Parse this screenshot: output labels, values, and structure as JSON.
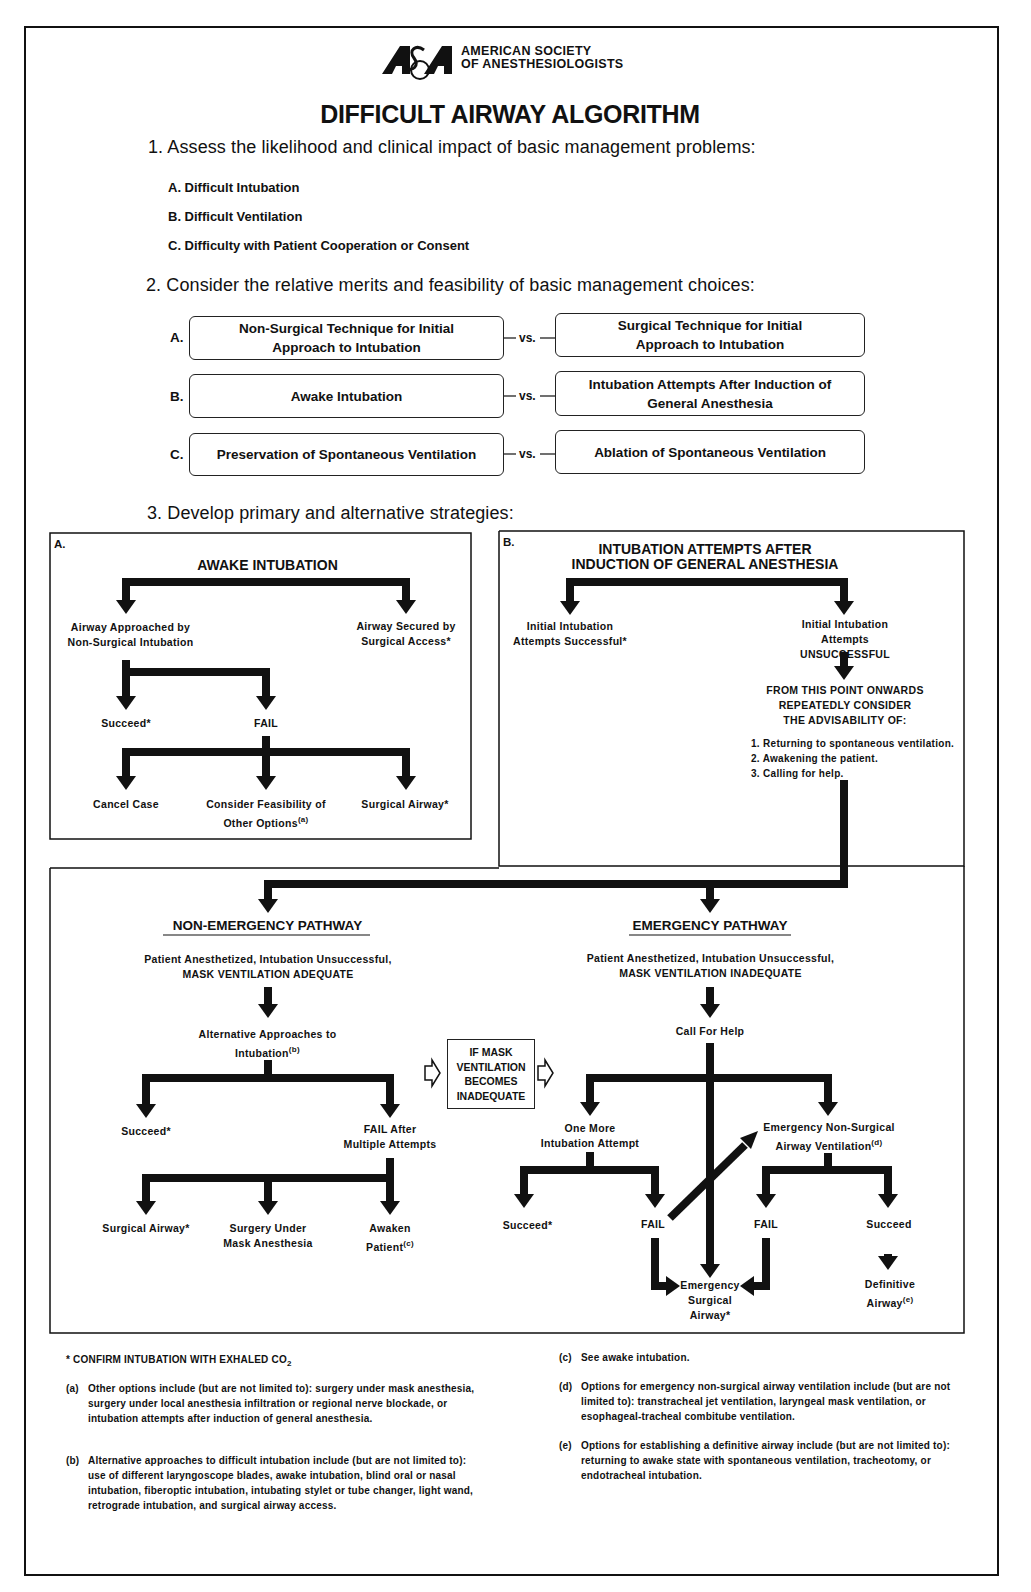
{
  "header": {
    "logo_text": "ASA",
    "org_line1": "AMERICAN SOCIETY",
    "org_line2": "OF ANESTHESIOLOGISTS",
    "title": "DIFFICULT AIRWAY ALGORITHM"
  },
  "step1": {
    "heading": "1. Assess the likelihood and clinical impact of basic management problems:",
    "items": [
      "A. Difficult Intubation",
      "B. Difficult Ventilation",
      "C. Difficulty with Patient Cooperation or Consent"
    ]
  },
  "step2": {
    "heading": "2. Consider the relative merits and feasibility of basic management choices:",
    "vs_label": "vs.",
    "rows": [
      {
        "key": "A.",
        "left": "Non-Surgical Technique for Initial Approach to Intubation",
        "right": "Surgical Technique for Initial Approach to Intubation"
      },
      {
        "key": "B.",
        "left": "Awake Intubation",
        "right": "Intubation Attempts After Induction of General Anesthesia"
      },
      {
        "key": "C.",
        "left": "Preservation of Spontaneous Ventilation",
        "right": "Ablation of Spontaneous Ventilation"
      }
    ]
  },
  "step3": {
    "heading": "3. Develop primary and alternative strategies:",
    "panelA": {
      "key": "A.",
      "title": "AWAKE INTUBATION",
      "left_node": "Airway Approached by Non-Surgical Intubation",
      "right_node": "Airway Secured by Surgical Access*",
      "succeed": "Succeed*",
      "fail": "FAIL",
      "outcomes": [
        "Cancel Case",
        "Consider Feasibility of Other Options",
        "Surgical Airway*"
      ],
      "outcome_footnote": "(a)"
    },
    "panelB": {
      "key": "B.",
      "title_line1": "INTUBATION ATTEMPTS AFTER",
      "title_line2": "INDUCTION OF GENERAL ANESTHESIA",
      "left_node": "Initial Intubation Attempts Successful*",
      "right_node": "Initial Intubation Attempts UNSUCCESSFUL",
      "consider_line1": "FROM THIS POINT ONWARDS",
      "consider_line2": "REPEATEDLY CONSIDER",
      "consider_line3": "THE ADVISABILITY OF:",
      "options": [
        "1. Returning to spontaneous ventilation.",
        "2. Awakening the patient.",
        "3. Calling for help."
      ]
    },
    "non_emergency": {
      "title": "NON-EMERGENCY PATHWAY",
      "condition_line1": "Patient Anesthetized, Intubation Unsuccessful,",
      "condition_line2": "MASK VENTILATION ADEQUATE",
      "alt_approaches": "Alternative Approaches to Intubation",
      "alt_footnote": "(b)",
      "succeed": "Succeed*",
      "fail_multi_line1": "FAIL After",
      "fail_multi_line2": "Multiple Attempts",
      "outcomes": [
        "Surgical Airway*",
        "Surgery Under Mask Anesthesia",
        "Awaken Patient"
      ],
      "awaken_footnote": "(c)"
    },
    "transition_box": {
      "lines": [
        "IF MASK",
        "VENTILATION",
        "BECOMES",
        "INADEQUATE"
      ]
    },
    "emergency": {
      "title": "EMERGENCY PATHWAY",
      "condition_line1": "Patient Anesthetized, Intubation Unsuccessful,",
      "condition_line2": "MASK VENTILATION INADEQUATE",
      "call_help": "Call For Help",
      "one_more_line1": "One More",
      "one_more_line2": "Intubation Attempt",
      "nonsurg_line1": "Emergency Non-Surgical",
      "nonsurg_line2": "Airway Ventilation",
      "nonsurg_footnote": "(d)",
      "succeed_left": "Succeed*",
      "fail_left": "FAIL",
      "fail_right": "FAIL",
      "succeed_right": "Succeed",
      "surgical_line1": "Emergency",
      "surgical_line2": "Surgical",
      "surgical_line3": "Airway*",
      "definitive_line1": "Definitive",
      "definitive_line2": "Airway",
      "definitive_footnote": "(e)"
    }
  },
  "footnotes": {
    "star": "* CONFIRM INTUBATION WITH EXHALED CO",
    "star_sub": "2",
    "a_key": "(a)",
    "a": "Other options include (but are not limited to): surgery under mask anesthesia, surgery under local anesthesia infiltration or regional nerve blockade, or intubation attempts after induction of general anesthesia.",
    "b_key": "(b)",
    "b": "Alternative approaches to difficult intubation include (but are not limited to): use of different laryngoscope blades, awake intubation, blind oral or nasal intubation, fiberoptic intubation, intubating stylet or tube changer, light wand, retrograde intubation, and surgical airway access.",
    "c_key": "(c)",
    "c": "See awake intubation.",
    "d_key": "(d)",
    "d": "Options for emergency non-surgical airway ventilation include (but are not limited to): transtracheal jet ventilation, laryngeal mask ventilation, or esophageal-tracheal combitube ventilation.",
    "e_key": "(e)",
    "e": "Options for establishing a definitive airway include (but are not limited to): returning to awake state with spontaneous ventilation, tracheotomy, or endotracheal intubation."
  },
  "colors": {
    "ink": "#111111",
    "paper": "#ffffff"
  }
}
